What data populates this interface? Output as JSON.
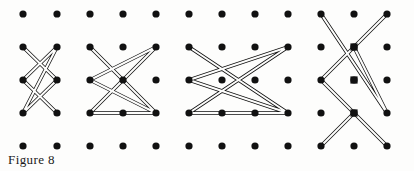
{
  "figure": {
    "caption": "Figure 8",
    "caption_position": {
      "x": 8,
      "y": 152
    },
    "canvas": {
      "width": 414,
      "height": 171
    },
    "background_color": "#fdfdfc",
    "ink_color": "#111111"
  },
  "lattice": {
    "name": "dot-grid",
    "columns": 11,
    "rows": 5,
    "col_x": [
      23,
      57,
      90,
      123,
      156,
      189,
      222,
      255,
      288,
      321,
      354
    ],
    "row_y": [
      14,
      47,
      80,
      113,
      146
    ],
    "dot_radius": 3.6,
    "dot_color": "#111111",
    "extra_col_x": 387,
    "note_visible_dots": 55
  },
  "chart_data": {
    "type": "scatter",
    "title": "Figure 8",
    "xlabel": "",
    "ylabel": "",
    "grid": false,
    "x": [
      23,
      57,
      90,
      123,
      156,
      189,
      222,
      255,
      288,
      321,
      354,
      387
    ],
    "y": [
      14,
      47,
      80,
      113,
      146
    ]
  },
  "polylines": [
    {
      "name": "figure-1-zigzag",
      "index": 1,
      "stroke_color": "#111111",
      "band_width": 3.6,
      "points": [
        [
          23,
          47
        ],
        [
          57,
          80
        ],
        [
          23,
          113
        ],
        [
          57,
          47
        ],
        [
          23,
          80
        ],
        [
          57,
          113
        ]
      ]
    },
    {
      "name": "figure-2-zigzag",
      "index": 2,
      "stroke_color": "#111111",
      "band_width": 3.6,
      "points": [
        [
          90,
          47
        ],
        [
          156,
          113
        ],
        [
          90,
          80
        ],
        [
          156,
          47
        ],
        [
          123,
          80
        ],
        [
          90,
          113
        ],
        [
          156,
          113
        ]
      ]
    },
    {
      "name": "figure-3-zigzag",
      "index": 3,
      "stroke_color": "#111111",
      "band_width": 3.6,
      "points": [
        [
          189,
          47
        ],
        [
          288,
          113
        ],
        [
          189,
          80
        ],
        [
          288,
          47
        ],
        [
          189,
          113
        ],
        [
          288,
          113
        ]
      ]
    },
    {
      "name": "figure-4-zigzag",
      "index": 4,
      "stroke_color": "#111111",
      "band_width": 3.6,
      "points": [
        [
          321,
          14
        ],
        [
          387,
          113
        ],
        [
          354,
          47
        ],
        [
          387,
          14
        ],
        [
          321,
          80
        ],
        [
          387,
          146
        ],
        [
          354,
          113
        ],
        [
          321,
          146
        ]
      ]
    }
  ],
  "node_markers": [
    {
      "name": "node-marker",
      "x": 354,
      "y": 47
    },
    {
      "name": "node-marker",
      "x": 354,
      "y": 80
    },
    {
      "name": "node-marker",
      "x": 354,
      "y": 113
    }
  ]
}
